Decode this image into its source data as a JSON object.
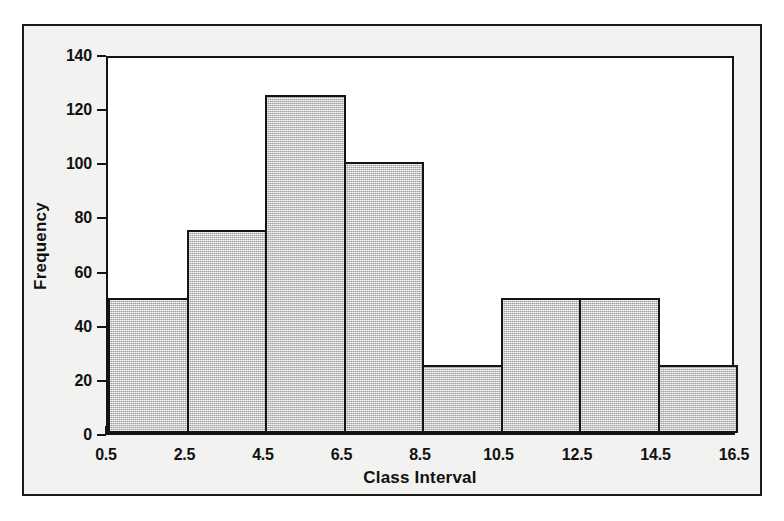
{
  "chart_data": {
    "type": "bar",
    "title": "",
    "subtitle": "",
    "xlabel": "Class Interval",
    "ylabel": "Frequency",
    "categories": [
      "0.5-2.5",
      "2.5-4.5",
      "4.5-6.5",
      "6.5-8.5",
      "8.5-10.5",
      "10.5-12.5",
      "12.5-14.5",
      "14.5-16.5"
    ],
    "bin_edges": [
      0.5,
      2.5,
      4.5,
      6.5,
      8.5,
      10.5,
      12.5,
      14.5,
      16.5
    ],
    "values": [
      50,
      75,
      125,
      100,
      25,
      50,
      50,
      25
    ],
    "xlim": [
      0.5,
      16.5
    ],
    "ylim": [
      0,
      140
    ],
    "x_ticks": [
      "0.5",
      "2.5",
      "4.5",
      "6.5",
      "8.5",
      "10.5",
      "12.5",
      "14.5",
      "16.5"
    ],
    "x_tick_values": [
      0.5,
      2.5,
      4.5,
      6.5,
      8.5,
      10.5,
      12.5,
      14.5,
      16.5
    ],
    "y_ticks": [
      "0",
      "20",
      "40",
      "60",
      "80",
      "100",
      "120",
      "140"
    ],
    "y_tick_values": [
      0,
      20,
      40,
      60,
      80,
      100,
      120,
      140
    ],
    "grid": false,
    "legend": null,
    "bar_fill_color": "#cccccc",
    "bar_edge_color": "#141414",
    "plot_background": "#ffffff",
    "figure_background": "#f2f2f0",
    "frame_color": "#1a1a1a"
  }
}
